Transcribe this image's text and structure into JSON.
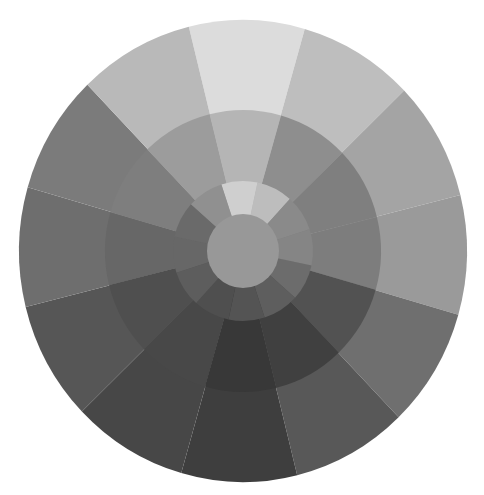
{
  "wheel": {
    "center": [
      243,
      251
    ],
    "radii_x": {
      "outer": 224,
      "middle": 138,
      "inner": 70,
      "core": 36
    },
    "radii_y": {
      "outer": 231,
      "middle": 141,
      "inner": 70,
      "core": 37
    },
    "segment_count": 12,
    "outer_start_angle": -104,
    "middle_start_angle": -104,
    "inner_start_angle": -108,
    "outer_ring": [
      "#dcdcdc",
      "#bebebe",
      "#a4a4a4",
      "#9a9a9a",
      "#6f6f6f",
      "#585858",
      "#3e3e3e",
      "#474747",
      "#565656",
      "#6e6e6e",
      "#7b7b7b",
      "#b9b9b9"
    ],
    "middle_ring": [
      "#b5b5b5",
      "#8e8e8e",
      "#7f7f7f",
      "#7d7d7d",
      "#525252",
      "#404040",
      "#383838",
      "#484848",
      "#4f4f4f",
      "#676767",
      "#7e7e7e",
      "#9c9c9c"
    ],
    "inner_ring": [
      "#cfcfcf",
      "#bdbdbd",
      "#8a8a8a",
      "#858585",
      "#6c6c6c",
      "#5e5e5e",
      "#545454",
      "#4f4f4f",
      "#5d5d5d",
      "#676767",
      "#6a6a6a",
      "#909090"
    ],
    "core_color": "#989898"
  }
}
